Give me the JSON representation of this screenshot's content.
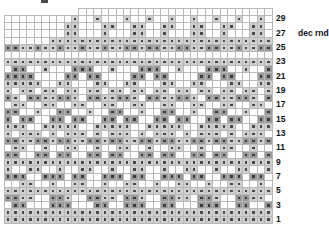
{
  "chart_title": "",
  "annotation": {
    "row": 27,
    "text": "dec rnd"
  },
  "legend_shades": {
    "white": "#ffffff",
    "light_gray": "#cfcfcf",
    "dark_gray": "#9a9a9a",
    "symbol_dot": "#4a4a4a",
    "gridline": "#b9b9b9"
  },
  "grid": {
    "columns": 36,
    "rows": 30,
    "cell_width_px": 7.45,
    "cell_height_px": 7.17
  },
  "row_labels": [
    {
      "row_index": 1,
      "label": "29",
      "note": ""
    },
    {
      "row_index": 3,
      "label": "27",
      "note": "dec rnd"
    },
    {
      "row_index": 5,
      "label": "25",
      "note": ""
    },
    {
      "row_index": 7,
      "label": "23",
      "note": ""
    },
    {
      "row_index": 9,
      "label": "21",
      "note": ""
    },
    {
      "row_index": 11,
      "label": "19",
      "note": ""
    },
    {
      "row_index": 13,
      "label": "17",
      "note": ""
    },
    {
      "row_index": 15,
      "label": "15",
      "note": ""
    },
    {
      "row_index": 17,
      "label": "13",
      "note": ""
    },
    {
      "row_index": 19,
      "label": "11",
      "note": ""
    },
    {
      "row_index": 21,
      "label": "9",
      "note": ""
    },
    {
      "row_index": 23,
      "label": "7",
      "note": ""
    },
    {
      "row_index": 25,
      "label": "5",
      "note": ""
    },
    {
      "row_index": 27,
      "label": "3",
      "note": ""
    },
    {
      "row_index": 29,
      "label": "1",
      "note": ""
    }
  ],
  "chart_data": {
    "type": "heatmap",
    "xlabel": "",
    "ylabel": "",
    "legend": [
      "white",
      "light gray",
      "dark gray"
    ],
    "note": "Each cell value is the shade level 0=white 1=light gray 2=dark gray. A value suffixed with d carries the small dot symbol.",
    "columns": 36,
    "rows": 30,
    "cells": [
      [
        "x",
        "x",
        "x",
        "x",
        "x",
        "x",
        "x",
        "x",
        "x",
        "x",
        "0",
        "0",
        "0",
        "0",
        "0",
        "0",
        "0",
        "0",
        "0",
        "0",
        "0",
        "0",
        "0",
        "0",
        "0",
        "0",
        "0",
        "0",
        "0",
        "0",
        "0",
        "0",
        "0",
        "0",
        "0",
        "0"
      ],
      [
        "0",
        "0",
        "0",
        "0",
        "0",
        "0",
        "0",
        "0",
        "0",
        "1d",
        "0",
        "0",
        "1d",
        "0",
        "0",
        "0",
        "1d",
        "0",
        "0",
        "1d",
        "0",
        "0",
        "1d",
        "0",
        "0",
        "1d",
        "0",
        "0",
        "1d",
        "0",
        "0",
        "1d",
        "0",
        "0",
        "1d",
        "0"
      ],
      [
        "0",
        "0",
        "0",
        "0",
        "0",
        "0",
        "0",
        "0",
        "1d",
        "1d",
        "0",
        "0",
        "0",
        "1d",
        "1d",
        "0",
        "0",
        "1d",
        "1d",
        "0",
        "0",
        "1d",
        "1d",
        "0",
        "0",
        "1d",
        "1d",
        "0",
        "0",
        "1d",
        "1d",
        "0",
        "0",
        "1d",
        "1d",
        "0"
      ],
      [
        "0",
        "0",
        "0",
        "0",
        "0",
        "0",
        "0",
        "0",
        "1d",
        "1d",
        "0",
        "0",
        "0",
        "1d",
        "0",
        "0",
        "0",
        "1d",
        "1d",
        "0",
        "0",
        "1d",
        "0",
        "0",
        "0",
        "1d",
        "1d",
        "0",
        "0",
        "1d",
        "0",
        "0",
        "0",
        "1d",
        "1d",
        "0"
      ],
      [
        "0",
        "0",
        "0",
        "0",
        "0",
        "0",
        "1d",
        "1d",
        "1d",
        "1d",
        "1d",
        "1d",
        "1d",
        "1d",
        "1d",
        "1d",
        "1d",
        "1d",
        "1d",
        "1d",
        "1d",
        "1d",
        "1d",
        "1d",
        "1d",
        "1d",
        "1d",
        "1d",
        "1d",
        "1d",
        "1d",
        "1d",
        "1d",
        "1d",
        "1d",
        "1d"
      ],
      [
        "2d",
        "2d",
        "1d",
        "1d",
        "2d",
        "1d",
        "1d",
        "2d",
        "1d",
        "1d",
        "2d",
        "1d",
        "1d",
        "2d",
        "1d",
        "1d",
        "2d",
        "2d",
        "1d",
        "2d",
        "2d",
        "1d",
        "1d",
        "2d",
        "2d",
        "1d",
        "1d",
        "2d",
        "2d",
        "1d",
        "1d",
        "2d",
        "1d",
        "1d",
        "2d",
        "2d"
      ],
      [
        "0",
        "0",
        "0",
        "0",
        "0",
        "0",
        "0",
        "0",
        "0",
        "0",
        "0",
        "0",
        "0",
        "0",
        "0",
        "0",
        "0",
        "0",
        "0",
        "0",
        "0",
        "0",
        "0",
        "0",
        "0",
        "0",
        "0",
        "0",
        "0",
        "0",
        "0",
        "0",
        "0",
        "0",
        "0",
        "0"
      ],
      [
        "1d",
        "1d",
        "1d",
        "1d",
        "1d",
        "1d",
        "1d",
        "1d",
        "1d",
        "1d",
        "1d",
        "1d",
        "1d",
        "1d",
        "1d",
        "1d",
        "1d",
        "1d",
        "1d",
        "1d",
        "1d",
        "1d",
        "1d",
        "1d",
        "1d",
        "1d",
        "1d",
        "1d",
        "1d",
        "1d",
        "1d",
        "1d",
        "1d",
        "1d",
        "1d",
        "1d"
      ],
      [
        "0",
        "2d",
        "2d",
        "0",
        "0",
        "1d",
        "0",
        "0",
        "0",
        "2d",
        "2d",
        "2d",
        "0",
        "0",
        "1d",
        "0",
        "0",
        "0",
        "2d",
        "2d",
        "2d",
        "0",
        "0",
        "1d",
        "0",
        "0",
        "0",
        "2d",
        "2d",
        "2d",
        "0",
        "0",
        "1d",
        "0",
        "0",
        "2d"
      ],
      [
        "2d",
        "2d",
        "2d",
        "2d",
        "0",
        "0",
        "0",
        "0",
        "2d",
        "2d",
        "0",
        "2d",
        "2d",
        "0",
        "0",
        "0",
        "0",
        "2d",
        "2d",
        "0",
        "2d",
        "2d",
        "0",
        "0",
        "0",
        "0",
        "2d",
        "2d",
        "0",
        "2d",
        "2d",
        "0",
        "0",
        "0",
        "2d",
        "2d"
      ],
      [
        "1d",
        "1d",
        "1d",
        "1d",
        "1d",
        "0",
        "0",
        "1d",
        "1d",
        "0",
        "0",
        "0",
        "1d",
        "1d",
        "0",
        "0",
        "1d",
        "1d",
        "0",
        "0",
        "0",
        "1d",
        "1d",
        "0",
        "0",
        "1d",
        "1d",
        "0",
        "0",
        "0",
        "1d",
        "1d",
        "0",
        "0",
        "1d",
        "1d"
      ],
      [
        "1d",
        "0",
        "1d",
        "1d",
        "0",
        "1d",
        "1d",
        "0",
        "1d",
        "1d",
        "0",
        "1d",
        "1d",
        "0",
        "1d",
        "1d",
        "0",
        "1d",
        "1d",
        "0",
        "1d",
        "1d",
        "0",
        "1d",
        "1d",
        "0",
        "1d",
        "1d",
        "0",
        "1d",
        "1d",
        "0",
        "1d",
        "1d",
        "0",
        "1d"
      ],
      [
        "2d",
        "1d",
        "0",
        "2d",
        "2d",
        "1d",
        "1d",
        "2d",
        "2d",
        "1d",
        "0",
        "2d",
        "2d",
        "1d",
        "1d",
        "2d",
        "2d",
        "1d",
        "0",
        "2d",
        "2d",
        "1d",
        "1d",
        "2d",
        "2d",
        "1d",
        "0",
        "2d",
        "2d",
        "1d",
        "1d",
        "2d",
        "2d",
        "1d",
        "0",
        "2d"
      ],
      [
        "0",
        "1d",
        "1d",
        "0",
        "0",
        "1d",
        "1d",
        "0",
        "0",
        "1d",
        "1d",
        "0",
        "0",
        "1d",
        "1d",
        "0",
        "0",
        "1d",
        "1d",
        "0",
        "0",
        "1d",
        "1d",
        "0",
        "0",
        "1d",
        "1d",
        "0",
        "0",
        "1d",
        "1d",
        "0",
        "0",
        "1d",
        "1d",
        "0"
      ],
      [
        "2d",
        "2d",
        "0",
        "0",
        "1d",
        "0",
        "0",
        "2d",
        "2d",
        "0",
        "0",
        "1d",
        "0",
        "0",
        "2d",
        "2d",
        "0",
        "0",
        "1d",
        "0",
        "0",
        "2d",
        "2d",
        "0",
        "0",
        "1d",
        "0",
        "0",
        "2d",
        "2d",
        "0",
        "0",
        "1d",
        "0",
        "0",
        "2d"
      ],
      [
        "2d",
        "0",
        "2d",
        "2d",
        "0",
        "0",
        "2d",
        "2d",
        "0",
        "2d",
        "2d",
        "0",
        "0",
        "2d",
        "2d",
        "0",
        "2d",
        "2d",
        "0",
        "0",
        "2d",
        "2d",
        "0",
        "2d",
        "2d",
        "0",
        "0",
        "2d",
        "2d",
        "0",
        "2d",
        "2d",
        "0",
        "0",
        "2d",
        "2d"
      ],
      [
        "1d",
        "1d",
        "1d",
        "0",
        "0",
        "1d",
        "1d",
        "1d",
        "1d",
        "1d",
        "0",
        "0",
        "1d",
        "1d",
        "1d",
        "1d",
        "1d",
        "0",
        "0",
        "1d",
        "1d",
        "1d",
        "1d",
        "1d",
        "0",
        "0",
        "1d",
        "1d",
        "1d",
        "1d",
        "1d",
        "0",
        "0",
        "1d",
        "1d",
        "1d"
      ],
      [
        "1d",
        "0",
        "1d",
        "1d",
        "1d",
        "0",
        "1d",
        "0",
        "1d",
        "1d",
        "1d",
        "0",
        "1d",
        "0",
        "1d",
        "1d",
        "1d",
        "0",
        "1d",
        "0",
        "1d",
        "1d",
        "1d",
        "0",
        "1d",
        "0",
        "1d",
        "1d",
        "1d",
        "0",
        "1d",
        "0",
        "1d",
        "1d",
        "1d",
        "0"
      ],
      [
        "2d",
        "2d",
        "1d",
        "1d",
        "2d",
        "2d",
        "1d",
        "2d",
        "2d",
        "1d",
        "1d",
        "2d",
        "2d",
        "1d",
        "2d",
        "2d",
        "1d",
        "1d",
        "2d",
        "2d",
        "1d",
        "2d",
        "2d",
        "1d",
        "1d",
        "2d",
        "2d",
        "1d",
        "2d",
        "2d",
        "1d",
        "1d",
        "2d",
        "2d",
        "1d",
        "2d"
      ],
      [
        "0",
        "1d",
        "1d",
        "0",
        "0",
        "1d",
        "0",
        "0",
        "1d",
        "1d",
        "0",
        "0",
        "1d",
        "0",
        "0",
        "1d",
        "1d",
        "0",
        "0",
        "1d",
        "0",
        "0",
        "1d",
        "1d",
        "0",
        "0",
        "1d",
        "0",
        "0",
        "1d",
        "1d",
        "0",
        "0",
        "1d",
        "0",
        "0"
      ],
      [
        "2d",
        "2d",
        "0",
        "0",
        "2d",
        "2d",
        "0",
        "2d",
        "2d",
        "0",
        "0",
        "2d",
        "2d",
        "0",
        "2d",
        "2d",
        "0",
        "0",
        "2d",
        "2d",
        "0",
        "2d",
        "2d",
        "0",
        "0",
        "2d",
        "2d",
        "0",
        "2d",
        "2d",
        "0",
        "0",
        "2d",
        "2d",
        "0",
        "2d"
      ],
      [
        "1d",
        "1d",
        "1d",
        "1d",
        "1d",
        "1d",
        "1d",
        "1d",
        "1d",
        "1d",
        "1d",
        "1d",
        "1d",
        "1d",
        "1d",
        "1d",
        "1d",
        "1d",
        "1d",
        "1d",
        "1d",
        "1d",
        "1d",
        "1d",
        "1d",
        "1d",
        "1d",
        "1d",
        "1d",
        "1d",
        "1d",
        "1d",
        "1d",
        "1d",
        "1d",
        "1d"
      ],
      [
        "1d",
        "0",
        "0",
        "1d",
        "1d",
        "0",
        "0",
        "1d",
        "0",
        "0",
        "1d",
        "1d",
        "0",
        "0",
        "1d",
        "0",
        "0",
        "1d",
        "1d",
        "0",
        "0",
        "1d",
        "0",
        "0",
        "1d",
        "1d",
        "0",
        "0",
        "1d",
        "0",
        "0",
        "1d",
        "1d",
        "0",
        "0",
        "1d"
      ],
      [
        "2d",
        "2d",
        "2d",
        "0",
        "0",
        "2d",
        "2d",
        "2d",
        "0",
        "2d",
        "2d",
        "0",
        "0",
        "2d",
        "2d",
        "2d",
        "0",
        "2d",
        "2d",
        "0",
        "0",
        "2d",
        "2d",
        "2d",
        "0",
        "2d",
        "2d",
        "0",
        "0",
        "2d",
        "2d",
        "2d",
        "0",
        "2d",
        "2d",
        "0"
      ],
      [
        "0",
        "0",
        "1d",
        "1d",
        "0",
        "0",
        "1d",
        "0",
        "0",
        "1d",
        "1d",
        "0",
        "0",
        "1d",
        "0",
        "0",
        "1d",
        "1d",
        "0",
        "0",
        "1d",
        "0",
        "0",
        "1d",
        "1d",
        "0",
        "0",
        "1d",
        "0",
        "0",
        "1d",
        "1d",
        "0",
        "0",
        "1d",
        "0"
      ],
      [
        "1d",
        "1d",
        "1d",
        "1d",
        "1d",
        "1d",
        "1d",
        "1d",
        "1d",
        "1d",
        "1d",
        "1d",
        "1d",
        "1d",
        "1d",
        "1d",
        "1d",
        "1d",
        "1d",
        "1d",
        "1d",
        "1d",
        "1d",
        "1d",
        "1d",
        "1d",
        "1d",
        "1d",
        "1d",
        "1d",
        "1d",
        "1d",
        "1d",
        "1d",
        "1d",
        "1d"
      ],
      [
        "2d",
        "2d",
        "1d",
        "1d",
        "0",
        "0",
        "2d",
        "2d",
        "1d",
        "0",
        "0",
        "2d",
        "2d",
        "1d",
        "1d",
        "0",
        "2d",
        "2d",
        "1d",
        "0",
        "0",
        "2d",
        "2d",
        "1d",
        "1d",
        "0",
        "2d",
        "2d",
        "1d",
        "0",
        "0",
        "2d",
        "2d",
        "1d",
        "1d",
        "0"
      ],
      [
        "0",
        "2d",
        "2d",
        "0",
        "0",
        "0",
        "2d",
        "2d",
        "2d",
        "0",
        "0",
        "0",
        "2d",
        "2d",
        "0",
        "0",
        "2d",
        "2d",
        "2d",
        "0",
        "0",
        "2d",
        "2d",
        "0",
        "0",
        "0",
        "2d",
        "2d",
        "2d",
        "0",
        "0",
        "2d",
        "2d",
        "0",
        "0",
        "2d"
      ],
      [
        "1d",
        "1d",
        "1d",
        "1d",
        "1d",
        "1d",
        "1d",
        "1d",
        "1d",
        "1d",
        "1d",
        "1d",
        "1d",
        "1d",
        "1d",
        "1d",
        "1d",
        "1d",
        "1d",
        "1d",
        "1d",
        "1d",
        "1d",
        "1d",
        "1d",
        "1d",
        "1d",
        "1d",
        "1d",
        "1d",
        "1d",
        "1d",
        "1d",
        "1d",
        "1d",
        "1d"
      ],
      [
        "1d",
        "1d",
        "1d",
        "1d",
        "1d",
        "1d",
        "1d",
        "1d",
        "1d",
        "1d",
        "1d",
        "1d",
        "1d",
        "1d",
        "1d",
        "1d",
        "1d",
        "1d",
        "1d",
        "1d",
        "1d",
        "1d",
        "1d",
        "1d",
        "1d",
        "1d",
        "1d",
        "1d",
        "1d",
        "1d",
        "1d",
        "1d",
        "1d",
        "1d",
        "1d",
        "1d"
      ]
    ]
  }
}
